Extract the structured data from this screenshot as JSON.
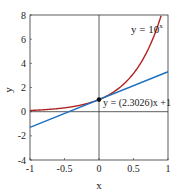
{
  "chart_data": {
    "type": "line",
    "title": "",
    "xlabel": "x",
    "ylabel": "y",
    "xlim": [
      -1,
      1
    ],
    "ylim": [
      -4,
      8
    ],
    "xticks": [
      "-1",
      "-0.5",
      "0",
      "0.5",
      "1"
    ],
    "yticks": [
      "-4",
      "-2",
      "0",
      "2",
      "4",
      "6",
      "8"
    ],
    "grid": false,
    "series": [
      {
        "name": "y = 10^x",
        "color": "#b22222",
        "function": "10^x",
        "x": [
          -1,
          -0.5,
          0,
          0.5,
          0.9031
        ],
        "y": [
          0.1,
          0.316,
          1,
          3.162,
          8
        ]
      },
      {
        "name": "y = (2.3026)x + 1",
        "color": "#1f6fbf",
        "function": "2.3026*x+1",
        "x": [
          -1,
          0,
          1
        ],
        "y": [
          -1.3026,
          1,
          3.3026
        ]
      }
    ],
    "annotations": [
      {
        "text": "y = 10",
        "sup": "x",
        "x": 0.45,
        "y": 6.8
      },
      {
        "text": "y = (2.3026)x +1",
        "x": 0.07,
        "y": 0.5
      },
      {
        "marker": "point",
        "x": 0,
        "y": 1
      }
    ]
  }
}
